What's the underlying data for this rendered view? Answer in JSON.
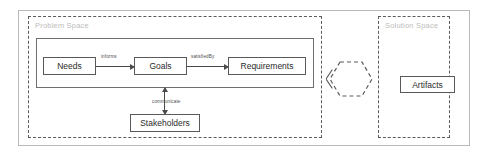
{
  "diagram": {
    "spaces": [
      {
        "id": "problem",
        "label": "Problem Space"
      },
      {
        "id": "solution",
        "label": "Solution Space"
      }
    ],
    "nodes": [
      {
        "id": "needs",
        "label": "Needs"
      },
      {
        "id": "goals",
        "label": "Goals"
      },
      {
        "id": "requirements",
        "label": "Requirements"
      },
      {
        "id": "stakeholders",
        "label": "Stakeholders"
      },
      {
        "id": "artifacts",
        "label": "Artifacts"
      }
    ],
    "edges": [
      {
        "id": "needs-goals",
        "label": "informs",
        "from": "needs",
        "to": "goals",
        "arrow": "single"
      },
      {
        "id": "goals-requirements",
        "label": "satisfiedBy",
        "from": "goals",
        "to": "requirements",
        "arrow": "single"
      },
      {
        "id": "group-stakeholders",
        "label": "communicate",
        "from": "group",
        "to": "stakeholders",
        "arrow": "double"
      }
    ],
    "bridge": {
      "id": "bridge-hexagon",
      "shape": "dashed-hexagon",
      "label": ""
    },
    "colors": {
      "outer_frame": "#b9b9b9",
      "dashed_border": "#5a5a5a",
      "node_border": "#595959",
      "group_border": "#6e6e6e",
      "space_label": "#bdbdbd",
      "text": "#2b2b2b",
      "arrow": "#4a4a4a",
      "background": "#ffffff"
    }
  }
}
